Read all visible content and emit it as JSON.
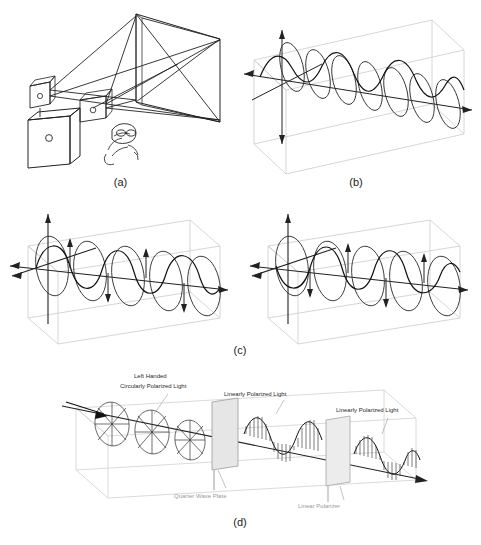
{
  "figure": {
    "background_color": "#ffffff",
    "line_color": "#222222",
    "faint_color": "#c8c8c8",
    "label_gray": "#9a9a9a"
  },
  "captions": {
    "a": "(a)",
    "b": "(b)",
    "c": "(c)",
    "d": "(d)"
  },
  "panels": {
    "a": {
      "name": "projector-screen-viewer-setup",
      "description": "Line drawing of a projector on a stand casting rays onto a large rectangular screen, with a small viewer wearing polarized glasses"
    },
    "b": {
      "name": "linearly-polarized-wave",
      "description": "Sinusoidal wave with circular field loops propagating along an axis inside a faint transparent box"
    },
    "c_left": {
      "name": "circularly-polarized-wave-left",
      "description": "Helical wave with circular cross-section rings and vertical/horizontal field arrows along the propagation axis"
    },
    "c_right": {
      "name": "circularly-polarized-wave-right",
      "description": "Mirror-handed helical wave with circular cross-section rings along the propagation axis"
    },
    "d": {
      "name": "quarter-wave-plate-and-polarizer-chain",
      "labels": {
        "left_handed": "Left Handed",
        "circularly_polarized": "Circularly Polarized Light",
        "quarter_wave_plate": "Quarter Wave Plate",
        "linearly_polarized_1": "Linearly Polarized Light",
        "linear_polarizer": "Linear Polarizer",
        "linearly_polarized_2": "Linearly Polarized Light"
      }
    }
  }
}
